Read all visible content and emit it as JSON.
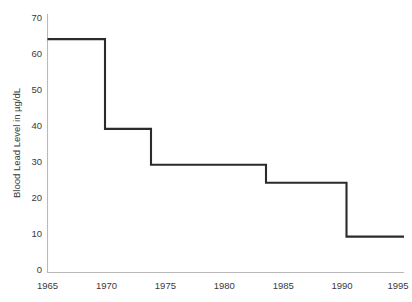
{
  "chart_data": {
    "type": "line",
    "subtype": "step-post",
    "title": "",
    "xlabel": "",
    "ylabel": "Blood Lead Level in µg/dL",
    "xlim": [
      1965,
      1996
    ],
    "ylim": [
      0,
      72
    ],
    "grid": false,
    "legend": null,
    "xticks": [
      1965,
      1970,
      1975,
      1980,
      1985,
      1990,
      1995
    ],
    "xtick_labels": [
      "1965",
      "1970",
      "1975",
      "1980",
      "1985",
      "1990",
      "1995"
    ],
    "yticks": [
      0,
      10,
      20,
      30,
      40,
      50,
      60,
      70
    ],
    "ytick_labels": [
      "0",
      "10",
      "20",
      "30",
      "40",
      "50",
      "60",
      "70"
    ],
    "line_color": "#2b2b2b",
    "axis_color": "#b9b9b9",
    "background_color": "#ffffff",
    "x": [
      1965,
      1970,
      1974,
      1984,
      1991,
      1996
    ],
    "values": [
      65,
      40,
      30,
      25,
      10,
      10
    ],
    "steps": [
      {
        "x_start": 1965,
        "x_end": 1970,
        "y": 65
      },
      {
        "x_start": 1970,
        "x_end": 1974,
        "y": 40
      },
      {
        "x_start": 1974,
        "x_end": 1984,
        "y": 30
      },
      {
        "x_start": 1984,
        "x_end": 1991,
        "y": 25
      },
      {
        "x_start": 1991,
        "x_end": 1996,
        "y": 10
      }
    ]
  }
}
